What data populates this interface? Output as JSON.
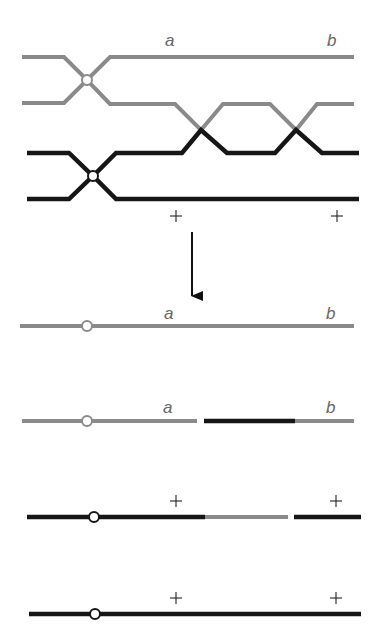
{
  "diagram": {
    "colors": {
      "gray": "#8a8a8a",
      "black": "#161616",
      "background": "#ffffff"
    },
    "top_panel": {
      "labels": [
        {
          "text": "a",
          "x": 170,
          "y": 46
        },
        {
          "text": "b",
          "x": 332,
          "y": 46
        },
        {
          "text": "+",
          "x": 176,
          "y": 216
        },
        {
          "text": "+",
          "x": 337,
          "y": 216
        }
      ]
    },
    "arrow": {
      "direction": "down"
    },
    "products": [
      {
        "index": 1,
        "labels": [
          "a",
          "b"
        ],
        "description": "parental gray chromatid"
      },
      {
        "index": 2,
        "labels": [
          "a",
          "b"
        ],
        "description": "recombinant gray-black-gray chromatid"
      },
      {
        "index": 3,
        "labels": [
          "+",
          "+"
        ],
        "description": "recombinant black-gray-black chromatid"
      },
      {
        "index": 4,
        "labels": [
          "+",
          "+"
        ],
        "description": "parental black chromatid"
      }
    ],
    "product_labels": {
      "p1_a": "a",
      "p1_b": "b",
      "p2_a": "a",
      "p2_b": "b",
      "p3_a": "+",
      "p3_b": "+",
      "p4_a": "+",
      "p4_b": "+"
    },
    "top_labels": {
      "a": "a",
      "b": "b",
      "plus1": "+",
      "plus2": "+"
    }
  }
}
